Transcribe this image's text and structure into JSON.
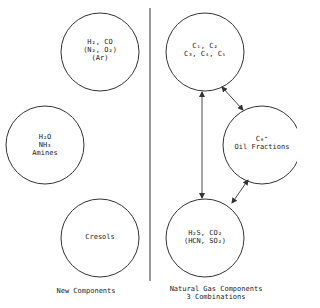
{
  "diagram": {
    "colors": {
      "stroke": "#333333",
      "text": "#222222",
      "background": "#ffffff"
    },
    "divider": {
      "x": 150,
      "y1": 8,
      "y2": 281
    },
    "left_group": {
      "caption": "New Components",
      "circles": [
        {
          "id": "syngas",
          "cx": 100,
          "cy": 52,
          "r": 39,
          "lines": [
            "H2, CO",
            "(N2, O2)",
            "(Ar)"
          ]
        },
        {
          "id": "polar",
          "cx": 45,
          "cy": 145,
          "r": 39,
          "lines": [
            "H2O",
            "NH3",
            "Amines"
          ]
        },
        {
          "id": "cresols",
          "cx": 100,
          "cy": 238,
          "r": 39,
          "lines": [
            "Cresols"
          ]
        }
      ]
    },
    "right_group": {
      "caption_line1": "Natural Gas Components",
      "caption_line2": "3 Combinations",
      "circles": [
        {
          "id": "light-hydrocarbons",
          "cx": 205,
          "cy": 52,
          "r": 39,
          "lines": [
            "C1, C2",
            "C3, C4, C5"
          ]
        },
        {
          "id": "oil-fractions",
          "cx": 262,
          "cy": 145,
          "r": 39,
          "lines": [
            "C6+",
            "Oil Fractions"
          ]
        },
        {
          "id": "acid-gases",
          "cx": 205,
          "cy": 238,
          "r": 39,
          "lines": [
            "H2S, CO2",
            "(HCN, SO2)"
          ]
        }
      ],
      "arrows": [
        {
          "from": "light-hydrocarbons",
          "to": "acid-gases",
          "bidirectional": true
        },
        {
          "from": "light-hydrocarbons",
          "to": "oil-fractions",
          "bidirectional": true
        },
        {
          "from": "oil-fractions",
          "to": "acid-gases",
          "bidirectional": true
        }
      ]
    },
    "labels": {
      "syngas_l1": "H₂, CO",
      "syngas_l2": "(N₂, O₂)",
      "syngas_l3": "(Ar)",
      "polar_l1": "H₂O",
      "polar_l2": "NH₃",
      "polar_l3": "Amines",
      "cresols_l1": "Cresols",
      "light_l1": "C₁, C₂",
      "light_l2": "C₃, C₄, C₅",
      "oil_l1": "C₆⁺",
      "oil_l2": "Oil Fractions",
      "acid_l1": "H₂S, CO₂",
      "acid_l2": "(HCN, SO₂)"
    }
  }
}
